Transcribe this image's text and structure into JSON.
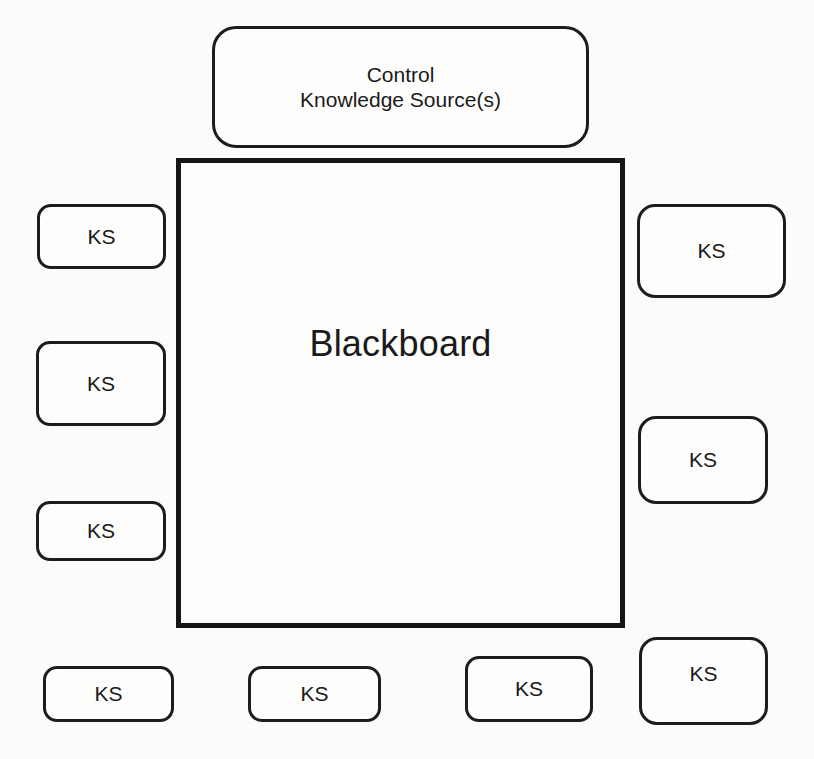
{
  "diagram": {
    "control": {
      "line1": "Control",
      "line2": "Knowledge Source(s)"
    },
    "blackboard": {
      "label": "Blackboard"
    },
    "knowledge_sources": {
      "left": [
        {
          "label": "KS"
        },
        {
          "label": "KS"
        },
        {
          "label": "KS"
        }
      ],
      "right": [
        {
          "label": "KS"
        },
        {
          "label": "KS"
        },
        {
          "label": "KS"
        }
      ],
      "bottom": [
        {
          "label": "KS"
        },
        {
          "label": "KS"
        },
        {
          "label": "KS"
        }
      ]
    },
    "colors": {
      "stroke": "#1c1c1c",
      "background": "#fbfbfa"
    }
  }
}
